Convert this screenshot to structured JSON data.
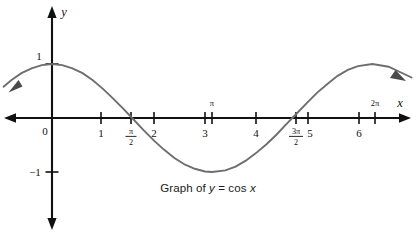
{
  "figure": {
    "caption_prefix": "Graph of ",
    "caption_y": "y",
    "caption_eq": " = cos ",
    "caption_x": "x",
    "caption_full": "Graph of y = cos x",
    "curve_color": "#6e6e6e",
    "axis_color": "#111111",
    "background": "#ffffff"
  },
  "axes": {
    "x_label": "x",
    "y_label": "y",
    "origin_label": "0"
  },
  "x_ticks": [
    {
      "label": "1",
      "value": 1,
      "position": "below"
    },
    {
      "label": "2",
      "value": 2,
      "position": "below"
    },
    {
      "label": "3",
      "value": 3,
      "position": "below"
    },
    {
      "label": "4",
      "value": 4,
      "position": "below"
    },
    {
      "label": "5",
      "value": 5,
      "position": "below"
    },
    {
      "label": "6",
      "value": 6,
      "position": "below"
    }
  ],
  "x_special_ticks": [
    {
      "label": "pi/2",
      "numerator": "π",
      "denominator": "2",
      "value": 1.5708,
      "position": "below"
    },
    {
      "label": "pi",
      "text": "π",
      "value": 3.1416,
      "position": "above"
    },
    {
      "label": "3pi/2",
      "numerator": "3π",
      "denominator": "2",
      "value": 4.7124,
      "position": "below"
    },
    {
      "label": "2pi",
      "text": "2π",
      "value": 6.2832,
      "position": "above"
    }
  ],
  "y_ticks": [
    {
      "label": "1",
      "value": 1
    },
    {
      "label": "−1",
      "value": -1
    }
  ],
  "chart_data": {
    "type": "line",
    "title": "Graph of y = cos x",
    "function": "y = cos x",
    "xlabel": "x",
    "ylabel": "y",
    "xlim": [
      -0.95,
      7.05
    ],
    "ylim": [
      -1.55,
      2.2
    ],
    "grid": false,
    "legend": null,
    "series": [
      {
        "name": "cos x",
        "color": "#6e6e6e",
        "x": [
          -0.95,
          -0.8,
          -0.6,
          -0.4,
          -0.2,
          0,
          0.2,
          0.4,
          0.6,
          0.8,
          1,
          1.2,
          1.4,
          1.5708,
          1.8,
          2,
          2.2,
          2.4,
          2.6,
          2.8,
          3,
          3.1416,
          3.4,
          3.6,
          3.8,
          4,
          4.2,
          4.4,
          4.6,
          4.7124,
          5,
          5.2,
          5.4,
          5.6,
          5.8,
          6,
          6.2832,
          6.6,
          7.05
        ],
        "y": [
          0.58,
          0.7,
          0.83,
          0.92,
          0.98,
          1,
          0.98,
          0.92,
          0.83,
          0.7,
          0.54,
          0.36,
          0.17,
          0,
          -0.23,
          -0.42,
          -0.59,
          -0.74,
          -0.86,
          -0.94,
          -0.99,
          -1,
          -0.97,
          -0.9,
          -0.79,
          -0.65,
          -0.49,
          -0.31,
          -0.11,
          0,
          0.28,
          0.47,
          0.63,
          0.78,
          0.89,
          0.96,
          1,
          0.95,
          0.75
        ]
      }
    ],
    "key_points": [
      {
        "x": 0,
        "y": 1,
        "desc": "maximum"
      },
      {
        "x": 1.5708,
        "y": 0,
        "desc": "zero at pi/2"
      },
      {
        "x": 3.1416,
        "y": -1,
        "desc": "minimum at pi"
      },
      {
        "x": 4.7124,
        "y": 0,
        "desc": "zero at 3pi/2"
      },
      {
        "x": 6.2832,
        "y": 1,
        "desc": "maximum at 2pi"
      }
    ],
    "annotations": [
      {
        "text": "Graph of y = cos x",
        "x": 3.3,
        "y": -1.45
      }
    ]
  }
}
